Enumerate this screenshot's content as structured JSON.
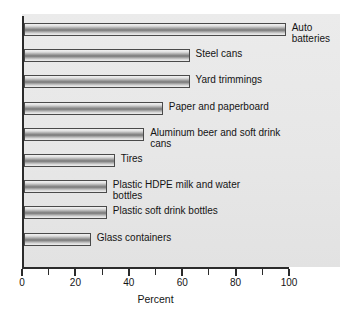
{
  "chart_data": {
    "type": "bar",
    "orientation": "horizontal",
    "title": "",
    "xlabel": "Percent",
    "ylabel": "",
    "xlim": [
      0,
      100
    ],
    "grid": false,
    "legend": "none",
    "xticks": [
      0,
      20,
      40,
      60,
      80,
      100
    ],
    "xtick_labels": [
      "0",
      "20",
      "40",
      "60",
      "80",
      "100"
    ],
    "minor_ticks": [
      10,
      30,
      50,
      70,
      90
    ],
    "categories": [
      "Auto\nbatteries",
      "Steel cans",
      "Yard trimmings",
      "Paper and paperboard",
      "Aluminum beer and soft drink cans",
      "Tires",
      "Plastic HDPE milk and water bottles",
      "Plastic soft drink bottles",
      "Glass containers"
    ],
    "values": [
      98,
      62,
      62,
      52,
      45,
      34,
      31,
      31,
      25
    ],
    "bar_face_color": "#a0a0a0",
    "bar_edge_color": "#4a4a4a",
    "plot_background": "#e8e8e8",
    "axis_color": "#2b2b2b"
  }
}
